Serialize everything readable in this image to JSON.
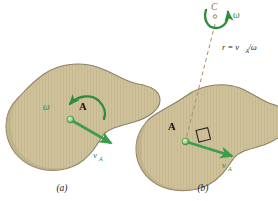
{
  "figure": {
    "colors": {
      "body_fill": "#cfc29b",
      "body_fill_dark": "#c4b78f",
      "body_outline": "#8d8263",
      "vector_green": "#3a9e4a",
      "arc_green": "#2f8c3c",
      "dash_line": "#b08b72",
      "label_dark": "#17140d",
      "label_c": "#9c6b47",
      "background": "#ffffff"
    },
    "panels": [
      {
        "id": "a",
        "caption": "(a)",
        "point_label": "A",
        "omega_label": "ω",
        "velocity_label": "v",
        "velocity_subscript": "A",
        "description": "Rigid body rotating with angular velocity omega; point A has velocity v_A"
      },
      {
        "id": "b",
        "caption": "(b)",
        "point_label": "A",
        "center_label": "C",
        "omega_label": "ω",
        "velocity_label": "v",
        "velocity_subscript": "A",
        "radius_label": "r = v",
        "radius_label_subscript": "A",
        "radius_label_tail": "/ω",
        "right_angle_marker": true,
        "description": "Instantaneous center C located a distance r = v_A/omega from A, perpendicular to v_A"
      }
    ]
  }
}
